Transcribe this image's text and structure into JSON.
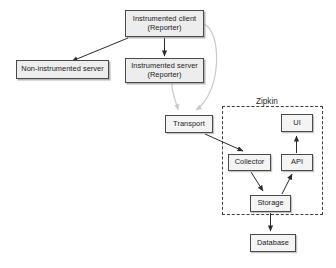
{
  "diagram": {
    "background": "#ffffff",
    "edge_color_solid": "#2b2b2b",
    "edge_color_muted": "#c9c9c9",
    "node_fill": "#ededed",
    "node_border": "#4a4a4a",
    "group": {
      "label": "Zipkin",
      "border_style": "dashed"
    },
    "nodes": {
      "instrumented_client": "Instrumented client\n(Reporter)",
      "noninstrumented_server": "Non-instrumented server",
      "instrumented_server": "Instrumented server\n(Reporter)",
      "transport": "Transport",
      "collector": "Collector",
      "api": "API",
      "ui": "UI",
      "storage": "Storage",
      "database": "Database"
    },
    "edges": [
      {
        "from": "instrumented_client",
        "to": "noninstrumented_server",
        "style": "solid"
      },
      {
        "from": "instrumented_client",
        "to": "instrumented_server",
        "style": "solid"
      },
      {
        "from": "instrumented_client",
        "to": "transport",
        "style": "muted"
      },
      {
        "from": "instrumented_server",
        "to": "transport",
        "style": "muted"
      },
      {
        "from": "transport",
        "to": "collector",
        "style": "solid"
      },
      {
        "from": "collector",
        "to": "storage",
        "style": "solid"
      },
      {
        "from": "storage",
        "to": "api",
        "style": "solid"
      },
      {
        "from": "api",
        "to": "ui",
        "style": "solid"
      },
      {
        "from": "storage",
        "to": "database",
        "style": "solid"
      }
    ]
  }
}
